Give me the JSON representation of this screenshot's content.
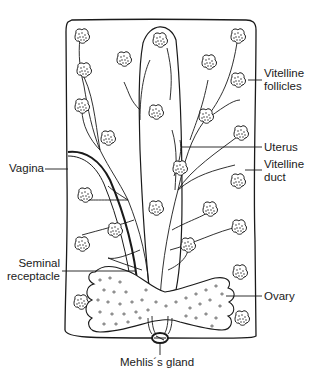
{
  "diagram": {
    "labels": {
      "vitelline_follicles": "Vitelline\nfollicles",
      "vitelline_follicles_l1": "Vitelline",
      "vitelline_follicles_l2": "follicles",
      "uterus": "Uterus",
      "vitelline_duct_l1": "Vitelline",
      "vitelline_duct_l2": "duct",
      "vagina": "Vagina",
      "seminal_receptacle_l1": "Seminal",
      "seminal_receptacle_l2": "receptacle",
      "ovary": "Ovary",
      "mehlis_gland": "Mehlis´s gland"
    },
    "colors": {
      "ink": "#1a1a1a",
      "background": "#ffffff"
    }
  }
}
